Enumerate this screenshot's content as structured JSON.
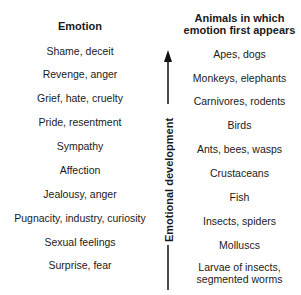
{
  "headers": {
    "emotion": "Emotion",
    "animals_line1": "Animals in which",
    "animals_line2": "emotion first appears"
  },
  "axis_label": "Emotional development",
  "rows": [
    {
      "emotion": "Shame, deceit",
      "animals": "Apes, dogs"
    },
    {
      "emotion": "Revenge, anger",
      "animals": "Monkeys, elephants"
    },
    {
      "emotion": "Grief, hate, cruelty",
      "animals": "Carnivores, rodents"
    },
    {
      "emotion": "Pride, resentment",
      "animals": "Birds"
    },
    {
      "emotion": "Sympathy",
      "animals": "Ants, bees, wasps"
    },
    {
      "emotion": "Affection",
      "animals": "Crustaceans"
    },
    {
      "emotion": "Jealousy, anger",
      "animals": "Fish"
    },
    {
      "emotion": "Pugnacity, industry, curiosity",
      "animals": "Insects, spiders"
    },
    {
      "emotion": "Sexual feelings",
      "animals": "Molluscs"
    },
    {
      "emotion": "Surprise, fear",
      "animals": "Larvae of insects,",
      "animals_line2": "segmented worms"
    }
  ]
}
